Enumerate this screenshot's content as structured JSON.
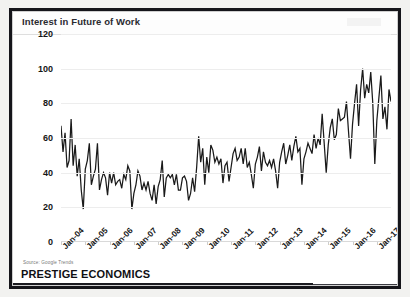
{
  "window": {
    "brand": "PRESTIGE ECONOMICS",
    "source_note": "Source:  Google Trends"
  },
  "chart_data": {
    "type": "line",
    "title": "Interest in Future of Work",
    "xlabel": "",
    "ylabel": "",
    "ylim": [
      0,
      120
    ],
    "yticks": [
      0,
      20,
      40,
      60,
      80,
      100,
      120
    ],
    "grid": true,
    "legend": false,
    "line_color": "#1a1a1a",
    "x_tick_labels": [
      "Jan-04",
      "Jan-05",
      "Jan-06",
      "Jan-07",
      "Jan-08",
      "Jan-09",
      "Jan-10",
      "Jan-11",
      "Jan-12",
      "Jan-13",
      "Jan-14",
      "Jan-15",
      "Jan-16",
      "Jan-17"
    ],
    "x_start": "Jan-04",
    "x_end": "Jun-17",
    "x_frequency": "monthly",
    "series": [
      {
        "name": "Interest in Future of Work",
        "values": [
          67,
          52,
          63,
          43,
          47,
          71,
          44,
          56,
          38,
          48,
          30,
          19,
          42,
          47,
          57,
          33,
          38,
          42,
          57,
          30,
          36,
          40,
          37,
          27,
          40,
          34,
          40,
          33,
          35,
          36,
          31,
          39,
          36,
          44,
          41,
          19,
          28,
          33,
          41,
          38,
          30,
          34,
          30,
          35,
          28,
          24,
          33,
          22,
          32,
          36,
          47,
          26,
          37,
          39,
          37,
          39,
          33,
          39,
          30,
          30,
          37,
          38,
          35,
          24,
          28,
          37,
          29,
          43,
          61,
          46,
          54,
          33,
          49,
          40,
          56,
          53,
          46,
          49,
          45,
          48,
          34,
          44,
          46,
          35,
          43,
          51,
          54,
          47,
          49,
          54,
          45,
          54,
          43,
          46,
          39,
          31,
          45,
          49,
          55,
          41,
          52,
          46,
          44,
          47,
          43,
          48,
          41,
          31,
          46,
          52,
          57,
          45,
          50,
          56,
          47,
          55,
          61,
          52,
          54,
          33,
          48,
          52,
          57,
          54,
          51,
          62,
          54,
          60,
          56,
          74,
          57,
          40,
          56,
          66,
          71,
          59,
          62,
          77,
          70,
          71,
          72,
          81,
          64,
          48,
          68,
          80,
          91,
          67,
          88,
          100,
          83,
          91,
          86,
          98,
          80,
          45,
          70,
          83,
          96,
          71,
          78,
          65,
          88,
          81
        ]
      }
    ]
  }
}
